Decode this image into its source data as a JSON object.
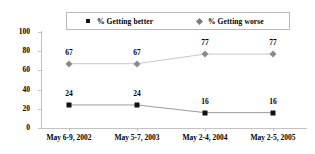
{
  "chart_data": {
    "type": "line",
    "title": "",
    "xlabel": "",
    "ylabel": "",
    "ylim": [
      0,
      100
    ],
    "yticks": [
      0,
      20,
      40,
      60,
      80,
      100
    ],
    "ytick_labels": [
      "0",
      "20",
      "40",
      "60",
      "80",
      "100"
    ],
    "grid": false,
    "legend_position": "top",
    "categories": [
      "May 6-9, 2002",
      "May 5-7, 2003",
      "May 2-4, 2004",
      "May 2-5, 2005"
    ],
    "series": [
      {
        "name": "% Getting better",
        "marker": "square-marker",
        "color": "#111111",
        "values": [
          24,
          24,
          16,
          16
        ],
        "point_labels": [
          "24",
          "24",
          "16",
          "16"
        ]
      },
      {
        "name": "% Getting worse",
        "marker": "diamond-marker",
        "color": "#8a8a8a",
        "values": [
          67,
          67,
          77,
          77
        ],
        "point_labels": [
          "67",
          "67",
          "77",
          "77"
        ]
      }
    ]
  },
  "legend": {
    "entries": [
      {
        "label": "% Getting better",
        "marker": "square-marker"
      },
      {
        "label": "% Getting worse",
        "marker": "diamond-marker"
      }
    ]
  },
  "axes": {
    "y_labels": [
      "100",
      "80",
      "60",
      "40",
      "20",
      "0"
    ],
    "x_labels": [
      "May 6-9, 2002",
      "May 5-7, 2003",
      "May 2-4, 2004",
      "May 2-5, 2005"
    ]
  }
}
